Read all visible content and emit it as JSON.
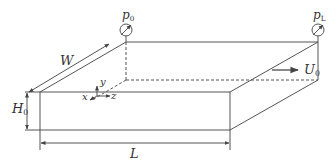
{
  "diagram": {
    "type": "rectangular-channel-schematic",
    "stroke_color": "#555555",
    "labels": {
      "width": "W",
      "height": "H",
      "height_sub": "0",
      "length": "L",
      "inlet_pressure": "p",
      "inlet_pressure_sub": "0",
      "outlet_pressure": "p",
      "outlet_pressure_sub": "L",
      "velocity": "U",
      "velocity_sub": "0",
      "axis_x": "x",
      "axis_y": "y",
      "axis_z": "z"
    }
  }
}
